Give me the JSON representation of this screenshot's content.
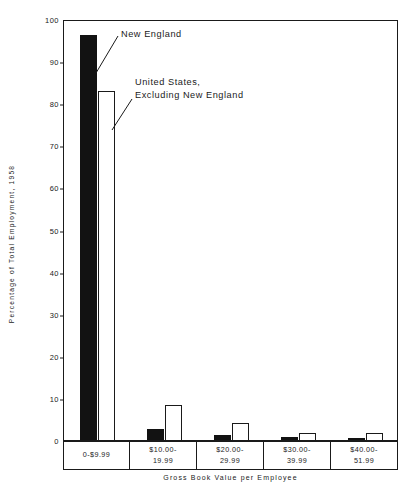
{
  "chart_data": {
    "type": "bar",
    "title": "",
    "xlabel": "Gross Book Value per Employee",
    "ylabel": "Percentage of Total Employment, 1958",
    "ylim": [
      0,
      100
    ],
    "ytick_values": [
      0,
      10,
      20,
      30,
      40,
      50,
      60,
      70,
      80,
      90,
      100
    ],
    "ytick_labels": [
      "0",
      "10",
      "20",
      "30",
      "40",
      "50",
      "60",
      "70",
      "80",
      "90",
      "100"
    ],
    "grid": false,
    "legend_position": "inline-annotation",
    "categories": [
      "0-$9.99",
      "$10.00-\n19.99",
      "$20.00-\n29.99",
      "$30.00-\n39.99",
      "$40.00-\n51.99"
    ],
    "series": [
      {
        "name": "New England",
        "color": "#121212",
        "style": "solid-black",
        "values": [
          96.2,
          2.6,
          1.1,
          0.6,
          0.4
        ]
      },
      {
        "name": "United States, Excluding New England",
        "color": "#ffffff",
        "style": "open-outline",
        "values": [
          82.9,
          8.3,
          4.0,
          1.6,
          1.6
        ]
      }
    ],
    "annotations": [
      {
        "id": "new-england",
        "text": "New England"
      },
      {
        "id": "united-states",
        "text": "United States,\nExcluding New England"
      }
    ]
  },
  "figure": {
    "title_strip": "",
    "frame_color": "#1a1a1a",
    "background": "#ffffff"
  }
}
